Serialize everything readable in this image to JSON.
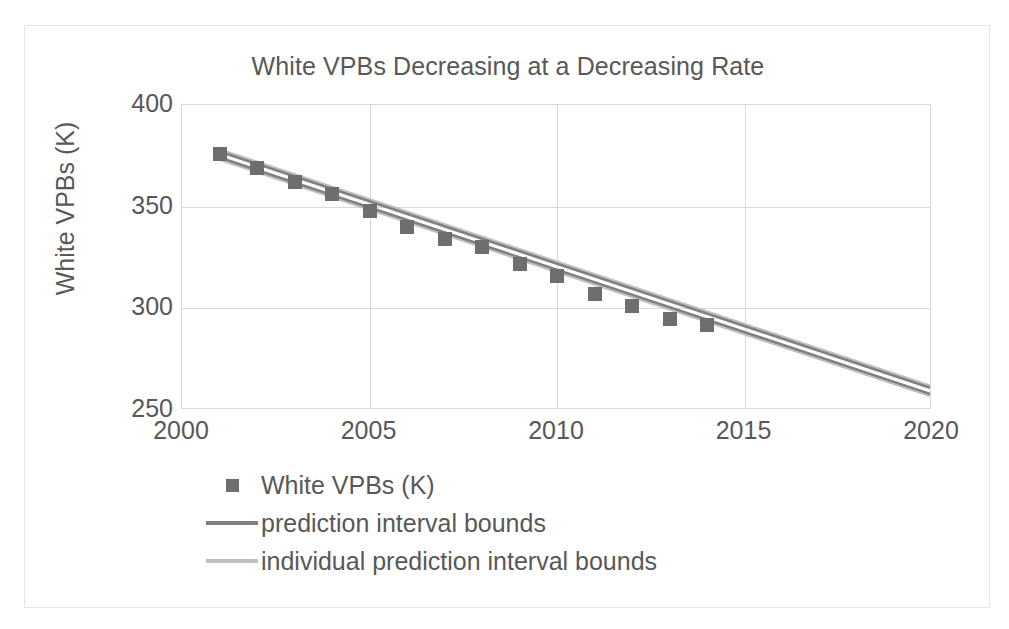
{
  "chart_data": {
    "type": "scatter",
    "title": "White VPBs Decreasing at a Decreasing Rate",
    "xlabel": "",
    "ylabel": "White VPBs (K)",
    "xlim": [
      2000,
      2020
    ],
    "ylim": [
      250,
      400
    ],
    "xticks": [
      "2000",
      "2005",
      "2010",
      "2015",
      "2020"
    ],
    "yticks": [
      "250",
      "300",
      "350",
      "400"
    ],
    "grid": true,
    "legend_position": "bottom",
    "x": [
      2001,
      2002,
      2003,
      2004,
      2005,
      2006,
      2007,
      2008,
      2009,
      2010,
      2011,
      2012,
      2013,
      2014
    ],
    "series": [
      {
        "name": "White VPBs (K)",
        "kind": "marker",
        "color": "#6e6e6e",
        "values": [
          376,
          369,
          362,
          356,
          348,
          340,
          334,
          330,
          322,
          316,
          307,
          301,
          295,
          292
        ]
      },
      {
        "name": "prediction interval bounds",
        "kind": "line",
        "color": "#808080",
        "x": [
          2001,
          2020
        ],
        "upper": [
          377,
          260
        ],
        "lower": [
          374,
          257
        ]
      },
      {
        "name": "individual prediction interval bounds",
        "kind": "line",
        "color": "#bfbfbf",
        "x": [
          2001,
          2020
        ],
        "upper": [
          378,
          261
        ],
        "lower": [
          373,
          256
        ]
      }
    ],
    "annotations": []
  },
  "legend": {
    "items": [
      {
        "label": "White VPBs (K)",
        "key": "square-marker",
        "color": "#6e6e6e"
      },
      {
        "label": "prediction interval bounds",
        "key": "line",
        "color": "#808080"
      },
      {
        "label": "individual prediction interval bounds",
        "key": "line",
        "color": "#bfbfbf"
      }
    ]
  },
  "axes": {
    "y_title": "White VPBs (K)",
    "y_ticks": [
      "400",
      "350",
      "300",
      "250"
    ],
    "x_ticks": [
      "2000",
      "2005",
      "2010",
      "2015",
      "2020"
    ]
  },
  "colors": {
    "text": "#585858",
    "grid": "#d9d9d9",
    "frame": "#e6e6e6",
    "marker": "#6e6e6e",
    "band_inner": "#808080",
    "band_outer": "#bfbfbf",
    "background": "#ffffff"
  }
}
